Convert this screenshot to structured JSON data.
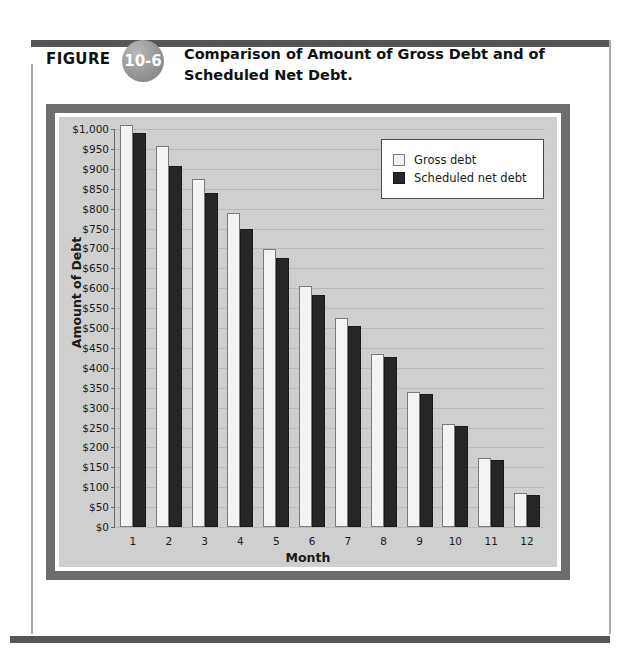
{
  "figure": {
    "label": "FIGURE",
    "number": "10-6",
    "title": "Comparison of Amount of Gross Debt and of Scheduled Net Debt."
  },
  "legend": {
    "position": "top-right",
    "items": [
      {
        "label": "Gross debt",
        "color": "#f3f3f1"
      },
      {
        "label": "Scheduled net debt",
        "color": "#262626"
      }
    ]
  },
  "chart_data": {
    "type": "bar",
    "title": "Comparison of Amount of Gross Debt and of Scheduled Net Debt.",
    "xlabel": "Month",
    "ylabel": "Amount of Debt",
    "categories": [
      "1",
      "2",
      "3",
      "4",
      "5",
      "6",
      "7",
      "8",
      "9",
      "10",
      "11",
      "12"
    ],
    "series": [
      {
        "name": "Gross debt",
        "color": "#f3f3f1",
        "values": [
          1010,
          958,
          875,
          790,
          698,
          605,
          525,
          435,
          340,
          260,
          173,
          85
        ]
      },
      {
        "name": "Scheduled net debt",
        "color": "#262626",
        "values": [
          990,
          908,
          840,
          750,
          675,
          583,
          505,
          427,
          333,
          255,
          168,
          80
        ]
      }
    ],
    "ylim": [
      0,
      1000
    ],
    "ytick_step": 50,
    "ytick_labels": [
      "$1,000",
      "$950",
      "$900",
      "$850",
      "$800",
      "$750",
      "$700",
      "$650",
      "$600",
      "$550",
      "$500",
      "$450",
      "$400",
      "$350",
      "$300",
      "$250",
      "$200",
      "$150",
      "$100",
      "$50",
      "$0"
    ],
    "ytick_values": [
      1000,
      950,
      900,
      850,
      800,
      750,
      700,
      650,
      600,
      550,
      500,
      450,
      400,
      350,
      300,
      250,
      200,
      150,
      100,
      50,
      0
    ],
    "grid": true,
    "legend_position": "top-right"
  }
}
